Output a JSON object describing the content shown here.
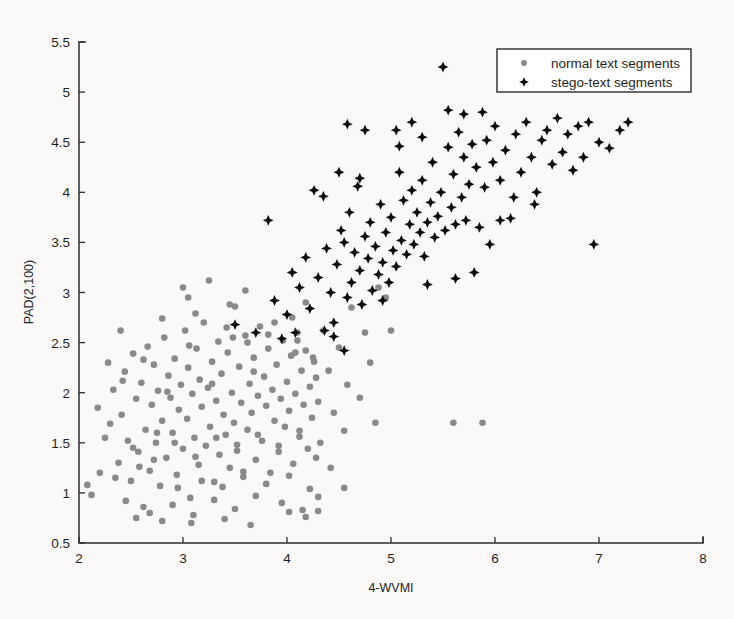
{
  "figure": {
    "background_color": "#fdfdfc",
    "axis_color": "#2b2b2b"
  },
  "chart_data": {
    "type": "scatter",
    "title": "",
    "xlabel": "4-WVMI",
    "ylabel": "PAD(2,100)",
    "xlim": [
      2,
      8
    ],
    "ylim": [
      0.5,
      5.5
    ],
    "xticks": [
      2,
      3,
      4,
      5,
      6,
      7,
      8
    ],
    "xtick_labels": [
      "2",
      "3",
      "4",
      "5",
      "6",
      "7",
      "8"
    ],
    "yticks": [
      0.5,
      1,
      1.5,
      2,
      2.5,
      3,
      3.5,
      4,
      4.5,
      5,
      5.5
    ],
    "ytick_labels": [
      "0.5",
      "1",
      "1.5",
      "2",
      "2.5",
      "3",
      "3.5",
      "4",
      "4.5",
      "5",
      "5.5"
    ],
    "grid": false,
    "legend_position": "upper right",
    "series": [
      {
        "name": "normal text segments",
        "marker": "circle",
        "color": "#8a8a8a",
        "size": 5.0,
        "points": [
          [
            2.08,
            1.08
          ],
          [
            2.12,
            0.98
          ],
          [
            2.3,
            1.69
          ],
          [
            2.33,
            2.03
          ],
          [
            2.38,
            1.3
          ],
          [
            2.41,
            1.78
          ],
          [
            2.44,
            2.21
          ],
          [
            2.47,
            1.52
          ],
          [
            2.5,
            1.12
          ],
          [
            2.52,
            2.39
          ],
          [
            2.55,
            1.94
          ],
          [
            2.57,
            1.41
          ],
          [
            2.6,
            2.1
          ],
          [
            2.62,
            0.86
          ],
          [
            2.64,
            1.63
          ],
          [
            2.66,
            2.46
          ],
          [
            2.68,
            1.22
          ],
          [
            2.7,
            1.88
          ],
          [
            2.72,
            2.28
          ],
          [
            2.74,
            1.5
          ],
          [
            2.76,
            2.02
          ],
          [
            2.78,
            1.07
          ],
          [
            2.8,
            1.72
          ],
          [
            2.82,
            2.55
          ],
          [
            2.84,
            1.35
          ],
          [
            2.86,
            2.17
          ],
          [
            2.88,
            1.95
          ],
          [
            2.9,
            1.6
          ],
          [
            2.92,
            2.34
          ],
          [
            2.94,
            1.18
          ],
          [
            2.96,
            1.83
          ],
          [
            2.98,
            2.08
          ],
          [
            3.0,
            1.44
          ],
          [
            3.02,
            2.62
          ],
          [
            3.04,
            1.74
          ],
          [
            3.05,
            2.25
          ],
          [
            3.07,
            0.95
          ],
          [
            3.09,
            1.99
          ],
          [
            3.11,
            1.55
          ],
          [
            3.13,
            2.44
          ],
          [
            3.15,
            1.28
          ],
          [
            3.16,
            2.13
          ],
          [
            3.18,
            1.86
          ],
          [
            3.2,
            2.7
          ],
          [
            3.22,
            1.47
          ],
          [
            3.24,
            2.05
          ],
          [
            3.26,
            1.66
          ],
          [
            3.28,
            2.31
          ],
          [
            3.3,
            1.11
          ],
          [
            3.32,
            1.92
          ],
          [
            3.34,
            2.51
          ],
          [
            3.35,
            1.38
          ],
          [
            3.37,
            2.19
          ],
          [
            3.39,
            1.78
          ],
          [
            3.41,
            1.58
          ],
          [
            3.43,
            2.4
          ],
          [
            3.45,
            1.25
          ],
          [
            3.47,
            2.0
          ],
          [
            3.49,
            1.7
          ],
          [
            3.5,
            2.86
          ],
          [
            3.52,
            1.48
          ],
          [
            3.54,
            2.26
          ],
          [
            3.56,
            1.9
          ],
          [
            3.58,
            1.16
          ],
          [
            3.6,
            2.57
          ],
          [
            3.62,
            1.63
          ],
          [
            3.64,
            2.09
          ],
          [
            3.66,
            1.8
          ],
          [
            3.68,
            2.35
          ],
          [
            3.7,
            1.33
          ],
          [
            3.72,
            1.97
          ],
          [
            3.74,
            2.66
          ],
          [
            3.76,
            1.52
          ],
          [
            3.78,
            2.16
          ],
          [
            3.8,
            1.87
          ],
          [
            3.82,
            2.44
          ],
          [
            3.84,
            1.2
          ],
          [
            3.86,
            2.03
          ],
          [
            3.88,
            1.72
          ],
          [
            3.9,
            2.28
          ],
          [
            3.92,
            1.41
          ],
          [
            3.94,
            1.94
          ],
          [
            3.96,
            2.52
          ],
          [
            3.98,
            1.66
          ],
          [
            4.0,
            2.11
          ],
          [
            4.02,
            1.82
          ],
          [
            4.04,
            2.37
          ],
          [
            4.06,
            1.29
          ],
          [
            4.08,
            1.99
          ],
          [
            4.1,
            2.6
          ],
          [
            4.12,
            1.56
          ],
          [
            4.14,
            2.22
          ],
          [
            4.16,
            1.88
          ],
          [
            4.18,
            2.42
          ],
          [
            4.2,
            1.44
          ],
          [
            4.22,
            2.06
          ],
          [
            4.24,
            1.75
          ],
          [
            4.26,
            2.31
          ],
          [
            4.28,
            1.35
          ],
          [
            4.3,
            1.91
          ],
          [
            2.45,
            0.92
          ],
          [
            2.68,
            0.8
          ],
          [
            2.9,
            0.88
          ],
          [
            3.1,
            0.78
          ],
          [
            3.3,
            0.93
          ],
          [
            3.5,
            0.84
          ],
          [
            3.7,
            0.97
          ],
          [
            3.95,
            0.9
          ],
          [
            4.15,
            0.83
          ],
          [
            4.3,
            0.96
          ],
          [
            2.35,
            1.15
          ],
          [
            2.58,
            1.26
          ],
          [
            2.75,
            1.6
          ],
          [
            2.95,
            1.05
          ],
          [
            3.18,
            1.12
          ],
          [
            3.38,
            1.06
          ],
          [
            3.58,
            1.21
          ],
          [
            3.8,
            1.09
          ],
          [
            4.02,
            1.17
          ],
          [
            4.22,
            1.04
          ],
          [
            2.42,
            2.12
          ],
          [
            2.62,
            2.33
          ],
          [
            2.85,
            2.01
          ],
          [
            3.06,
            2.47
          ],
          [
            3.28,
            2.09
          ],
          [
            3.48,
            2.55
          ],
          [
            3.68,
            2.21
          ],
          [
            3.88,
            2.7
          ],
          [
            4.08,
            2.4
          ],
          [
            4.28,
            2.15
          ],
          [
            2.52,
            1.45
          ],
          [
            2.72,
            1.33
          ],
          [
            2.92,
            1.5
          ],
          [
            3.12,
            1.36
          ],
          [
            3.32,
            1.55
          ],
          [
            3.52,
            1.42
          ],
          [
            3.72,
            1.58
          ],
          [
            3.92,
            1.47
          ],
          [
            4.12,
            1.62
          ],
          [
            4.32,
            1.5
          ],
          [
            3.0,
            3.05
          ],
          [
            3.05,
            2.95
          ],
          [
            3.25,
            3.12
          ],
          [
            3.45,
            2.88
          ],
          [
            3.6,
            3.02
          ],
          [
            3.12,
            2.79
          ],
          [
            2.8,
            2.74
          ],
          [
            4.05,
            2.75
          ],
          [
            4.18,
            2.9
          ],
          [
            4.35,
            2.62
          ],
          [
            4.4,
            2.22
          ],
          [
            4.45,
            1.8
          ],
          [
            4.5,
            2.45
          ],
          [
            4.55,
            1.62
          ],
          [
            4.58,
            2.08
          ],
          [
            4.62,
            2.85
          ],
          [
            4.7,
            1.95
          ],
          [
            4.75,
            2.6
          ],
          [
            4.8,
            2.3
          ],
          [
            4.85,
            1.7
          ],
          [
            4.42,
            1.25
          ],
          [
            4.55,
            1.05
          ],
          [
            4.3,
            0.82
          ],
          [
            4.18,
            0.76
          ],
          [
            4.02,
            0.81
          ],
          [
            5.6,
            1.7
          ],
          [
            5.88,
            1.7
          ],
          [
            4.88,
            3.05
          ],
          [
            5.0,
            2.62
          ],
          [
            4.95,
            2.95
          ],
          [
            2.25,
            1.55
          ],
          [
            2.28,
            2.3
          ],
          [
            2.2,
            1.2
          ],
          [
            2.18,
            1.85
          ],
          [
            2.4,
            2.62
          ],
          [
            3.42,
            2.65
          ],
          [
            3.62,
            2.5
          ],
          [
            3.82,
            2.58
          ],
          [
            4.1,
            2.52
          ],
          [
            4.25,
            2.35
          ],
          [
            2.55,
            0.75
          ],
          [
            2.8,
            0.72
          ],
          [
            3.08,
            0.7
          ],
          [
            3.4,
            0.74
          ],
          [
            3.65,
            0.68
          ]
        ]
      },
      {
        "name": "stego-text segments",
        "marker": "diamond",
        "color": "#0d0d0d",
        "size": 5.0,
        "points": [
          [
            3.5,
            2.68
          ],
          [
            3.7,
            2.6
          ],
          [
            3.82,
            3.72
          ],
          [
            3.88,
            2.92
          ],
          [
            4.0,
            2.78
          ],
          [
            4.05,
            3.2
          ],
          [
            4.12,
            3.05
          ],
          [
            4.18,
            3.35
          ],
          [
            4.22,
            2.84
          ],
          [
            4.3,
            3.15
          ],
          [
            4.35,
            3.96
          ],
          [
            4.38,
            3.44
          ],
          [
            4.42,
            3.0
          ],
          [
            4.45,
            2.7
          ],
          [
            4.48,
            3.28
          ],
          [
            4.52,
            3.62
          ],
          [
            4.55,
            3.5
          ],
          [
            4.58,
            2.95
          ],
          [
            4.6,
            3.8
          ],
          [
            4.62,
            3.1
          ],
          [
            4.65,
            3.4
          ],
          [
            4.68,
            4.06
          ],
          [
            4.7,
            3.22
          ],
          [
            4.72,
            2.88
          ],
          [
            4.75,
            3.56
          ],
          [
            4.78,
            3.34
          ],
          [
            4.8,
            3.7
          ],
          [
            4.82,
            3.02
          ],
          [
            4.85,
            3.46
          ],
          [
            4.88,
            3.18
          ],
          [
            4.9,
            3.88
          ],
          [
            4.92,
            3.3
          ],
          [
            4.95,
            3.6
          ],
          [
            4.98,
            3.1
          ],
          [
            5.0,
            3.75
          ],
          [
            5.02,
            3.42
          ],
          [
            5.05,
            3.26
          ],
          [
            5.08,
            4.2
          ],
          [
            5.1,
            3.52
          ],
          [
            5.12,
            3.92
          ],
          [
            5.15,
            3.38
          ],
          [
            5.18,
            3.68
          ],
          [
            5.2,
            4.02
          ],
          [
            5.22,
            3.48
          ],
          [
            5.25,
            3.8
          ],
          [
            5.28,
            3.6
          ],
          [
            5.3,
            4.12
          ],
          [
            5.32,
            3.36
          ],
          [
            5.35,
            3.7
          ],
          [
            5.38,
            3.9
          ],
          [
            5.4,
            4.3
          ],
          [
            5.42,
            3.55
          ],
          [
            5.45,
            3.76
          ],
          [
            5.48,
            4.0
          ],
          [
            5.5,
            5.25
          ],
          [
            5.52,
            3.62
          ],
          [
            5.55,
            4.45
          ],
          [
            5.58,
            3.85
          ],
          [
            5.6,
            4.18
          ],
          [
            5.62,
            3.68
          ],
          [
            5.65,
            4.6
          ],
          [
            5.68,
            3.95
          ],
          [
            5.7,
            4.35
          ],
          [
            5.72,
            3.72
          ],
          [
            5.75,
            4.08
          ],
          [
            5.78,
            4.48
          ],
          [
            5.8,
            3.2
          ],
          [
            5.82,
            4.25
          ],
          [
            5.85,
            3.65
          ],
          [
            5.88,
            4.8
          ],
          [
            5.9,
            4.05
          ],
          [
            5.92,
            4.52
          ],
          [
            5.95,
            3.48
          ],
          [
            5.98,
            4.3
          ],
          [
            6.0,
            4.66
          ],
          [
            6.05,
            4.12
          ],
          [
            6.1,
            4.42
          ],
          [
            6.15,
            3.74
          ],
          [
            6.2,
            4.58
          ],
          [
            6.25,
            4.2
          ],
          [
            6.3,
            4.7
          ],
          [
            6.35,
            4.35
          ],
          [
            6.4,
            4.0
          ],
          [
            6.45,
            4.52
          ],
          [
            6.5,
            4.62
          ],
          [
            6.55,
            4.28
          ],
          [
            6.6,
            4.74
          ],
          [
            6.65,
            4.4
          ],
          [
            6.7,
            4.58
          ],
          [
            6.75,
            4.22
          ],
          [
            6.8,
            4.66
          ],
          [
            6.85,
            4.35
          ],
          [
            6.9,
            4.7
          ],
          [
            6.95,
            3.48
          ],
          [
            7.0,
            4.5
          ],
          [
            7.1,
            4.44
          ],
          [
            7.2,
            4.62
          ],
          [
            7.28,
            4.7
          ],
          [
            4.58,
            4.68
          ],
          [
            4.75,
            4.62
          ],
          [
            4.26,
            4.02
          ],
          [
            4.55,
            2.42
          ],
          [
            4.45,
            2.56
          ],
          [
            4.08,
            2.6
          ],
          [
            3.95,
            2.54
          ],
          [
            4.7,
            4.14
          ],
          [
            5.08,
            4.46
          ],
          [
            5.2,
            4.7
          ],
          [
            5.55,
            4.82
          ],
          [
            5.7,
            4.78
          ],
          [
            6.18,
            3.95
          ],
          [
            6.38,
            3.88
          ],
          [
            5.35,
            3.08
          ],
          [
            5.62,
            3.14
          ],
          [
            4.92,
            2.92
          ],
          [
            4.36,
            2.62
          ],
          [
            4.5,
            4.2
          ],
          [
            5.05,
            4.62
          ],
          [
            5.3,
            4.55
          ],
          [
            6.05,
            3.72
          ]
        ]
      }
    ]
  },
  "legend": {
    "items": [
      {
        "label": "normal text segments",
        "marker": "circle",
        "color": "#8a8a8a"
      },
      {
        "label": "stego-text segments",
        "marker": "diamond",
        "color": "#0d0d0d"
      }
    ]
  }
}
